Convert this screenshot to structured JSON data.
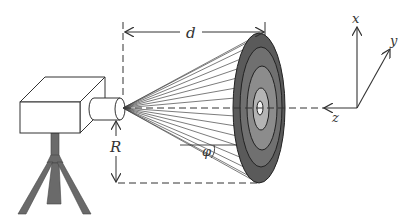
{
  "figure": {
    "labels": {
      "distance": "d",
      "radius": "R",
      "angle": "φ",
      "axis_x": "x",
      "axis_y": "y",
      "axis_z": "z"
    },
    "components": {
      "camera": "camera body on tripod with cylindrical lens",
      "target": "concentric ring target (4 shaded rings with bright center)",
      "rays": "fan of lines from lens to target edge",
      "axes": "3D coordinate frame x (up), y (diagonal), z (toward camera)"
    },
    "colors": {
      "line": "#333333",
      "ring_outer": "#5a5a5a",
      "ring_2": "#707070",
      "ring_3": "#8c8c8c",
      "ring_4": "#b4b4b4",
      "center": "#f2f2f2",
      "tripod": "#6a6a6a",
      "background": "#ffffff"
    }
  }
}
